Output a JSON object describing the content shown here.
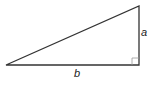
{
  "diagram": {
    "type": "right-triangle",
    "labels": {
      "vertical_side": "a",
      "horizontal_side": "b"
    },
    "colors": {
      "stroke": "#333333",
      "right_angle_marker": "#999999",
      "text": "#222222"
    },
    "vertices": {
      "left": [
        6,
        65
      ],
      "top": [
        139,
        6
      ],
      "right_angle": [
        139,
        65
      ]
    }
  }
}
